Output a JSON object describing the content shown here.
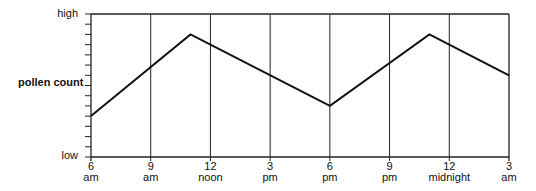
{
  "chart_data": {
    "type": "line",
    "title": "",
    "xlabel": "",
    "ylabel": "pollen count",
    "y_tick_labels": {
      "top": "high",
      "bottom": "low"
    },
    "y_scale": {
      "min": 0,
      "max": 14,
      "minor_ticks": 14,
      "numeric_labels": false
    },
    "x_ticks": [
      {
        "top": "6",
        "bottom": "am"
      },
      {
        "top": "9",
        "bottom": "am"
      },
      {
        "top": "12",
        "bottom": "noon"
      },
      {
        "top": "3",
        "bottom": "pm"
      },
      {
        "top": "6",
        "bottom": "pm"
      },
      {
        "top": "9",
        "bottom": "pm"
      },
      {
        "top": "12",
        "bottom": "midnight"
      },
      {
        "top": "3",
        "bottom": "am"
      }
    ],
    "x_unit": "hours after 6 am",
    "series": [
      {
        "name": "pollen count",
        "points": [
          {
            "x": 0,
            "time": "6 am",
            "y": 4
          },
          {
            "x": 5,
            "time": "11 am",
            "y": 12
          },
          {
            "x": 12,
            "time": "6 pm",
            "y": 5
          },
          {
            "x": 17,
            "time": "11 pm",
            "y": 12
          },
          {
            "x": 21,
            "time": "3 am",
            "y": 8
          }
        ]
      }
    ],
    "grid": {
      "vertical": true,
      "horizontal": false
    },
    "legend": "none"
  }
}
